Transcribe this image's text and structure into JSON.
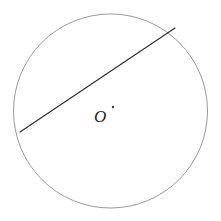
{
  "figure": {
    "kind": "geometry-diagram",
    "background_color": "#ffffff",
    "width": 221,
    "height": 221,
    "circle": {
      "name": "circle-outline",
      "center_x": 110.5,
      "center_y": 111,
      "radius": 97,
      "stroke_color": "#999999",
      "stroke_width": 1,
      "fill": "none"
    },
    "chord": {
      "name": "chord-line",
      "x1": 20,
      "y1": 132,
      "x2": 175,
      "y2": 28,
      "stroke_color": "#2b2b2b",
      "stroke_width": 1.1
    },
    "center_point": {
      "name": "center-dot",
      "x": 113,
      "y": 107,
      "radius": 1.2,
      "color": "#3a3a3a"
    },
    "labels": [
      {
        "name": "center-label-o",
        "text": "O",
        "x": 94,
        "y": 108,
        "font_size": 17,
        "style": "italic",
        "color": "#1d1d1d"
      }
    ]
  }
}
